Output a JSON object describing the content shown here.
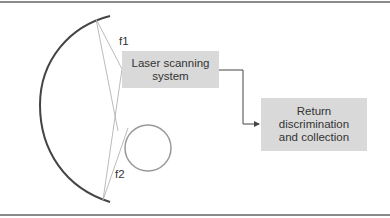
{
  "diagram": {
    "focus_labels": {
      "f1": "f1",
      "f2": "f2"
    },
    "boxes": {
      "laser_scanning": "Laser scanning system",
      "return_collection": "Return discrimination and collection"
    },
    "colors": {
      "box_fill": "#d9d9d9",
      "mirror_stroke": "#444444",
      "ray_stroke": "#aaaaaa",
      "target_stroke": "#999999",
      "arrow_stroke": "#444444"
    }
  }
}
